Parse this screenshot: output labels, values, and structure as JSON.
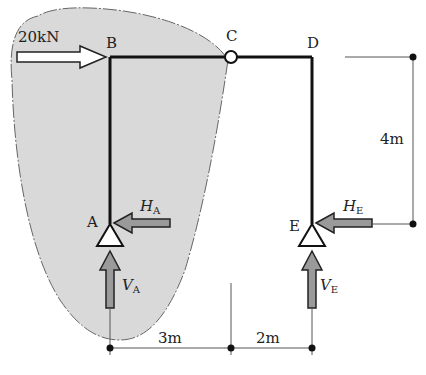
{
  "diagram": {
    "type": "three-hinged frame free-body diagram",
    "nodes": {
      "A": "A",
      "B": "B",
      "C": "C",
      "D": "D",
      "E": "E"
    },
    "load": {
      "label": "20kN",
      "direction": "right",
      "at": "B"
    },
    "reactions": {
      "HA": {
        "symbol": "H",
        "subscript": "A"
      },
      "VA": {
        "symbol": "V",
        "subscript": "A"
      },
      "HE": {
        "symbol": "H",
        "subscript": "E"
      },
      "VE": {
        "symbol": "V",
        "subscript": "E"
      }
    },
    "dimensions": {
      "span_AC": "3m",
      "span_CE": "2m",
      "height": "4m"
    },
    "colors": {
      "blob_fill": "#d9d9d9",
      "member": "#111111",
      "arrow_fill_gray": "#9a9a9a",
      "dimension_line": "#555555"
    }
  }
}
